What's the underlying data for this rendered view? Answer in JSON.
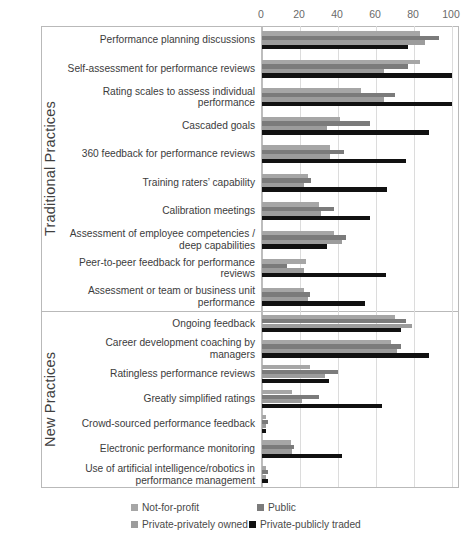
{
  "chart_data": {
    "type": "bar",
    "orientation": "horizontal",
    "title": "",
    "xlabel": "",
    "ylabel": "",
    "xlim": [
      0,
      100
    ],
    "xticks": [
      0,
      20,
      40,
      60,
      80,
      100
    ],
    "grid": true,
    "legend_position": "bottom",
    "series": [
      {
        "name": "Not-for-profit",
        "color": "#a6a6a6",
        "values": [
          83,
          83,
          52,
          41,
          36,
          24,
          30,
          38,
          23,
          22,
          70,
          68,
          25,
          16,
          2,
          15,
          2
        ]
      },
      {
        "name": "Public",
        "color": "#7b7b7b",
        "values": [
          93,
          77,
          70,
          57,
          43,
          26,
          38,
          44,
          13,
          25,
          76,
          73,
          40,
          30,
          3,
          17,
          3
        ]
      },
      {
        "name": "Private-privately owned",
        "color": "#9c9c9c",
        "values": [
          86,
          64,
          64,
          34,
          36,
          22,
          31,
          42,
          22,
          24,
          79,
          71,
          33,
          21,
          2,
          16,
          2
        ]
      },
      {
        "name": "Private-publicly traded",
        "color": "#111111",
        "values": [
          77,
          100,
          100,
          88,
          76,
          66,
          57,
          34,
          65,
          54,
          73,
          88,
          35,
          63,
          2,
          42,
          3
        ]
      }
    ],
    "sections": [
      {
        "name": "Traditional Practices",
        "categories": [
          "Performance planning discussions",
          "Self-assessment for performance reviews",
          "Rating scales to assess individual performance",
          "Cascaded goals",
          "360 feedback for performance reviews",
          "Training raters’ capability",
          "Calibration meetings",
          "Assessment of employee competencies / deep capabilities",
          "Peer-to-peer feedback for performance reviews",
          "Assessment or team or business unit performance"
        ]
      },
      {
        "name": "New Practices",
        "categories": [
          "Ongoing feedback",
          "Career development coaching by managers",
          "Ratingless performance reviews",
          "Greatly simplified ratings",
          "Crowd-sourced performance feedback",
          "Electronic performance monitoring",
          "Use of artificial intelligence/robotics in performance management"
        ]
      }
    ]
  },
  "legend": {
    "items": [
      {
        "label": "Not-for-profit"
      },
      {
        "label": "Public"
      },
      {
        "label": "Private-privately owned"
      },
      {
        "label": "Private-publicly traded"
      }
    ]
  }
}
